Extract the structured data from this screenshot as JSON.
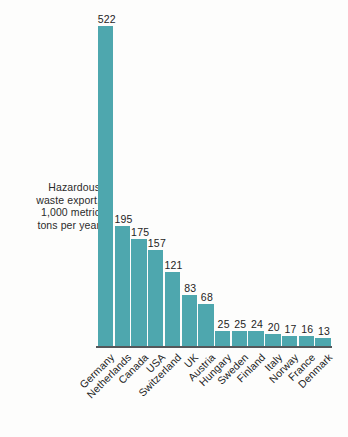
{
  "chart_data": {
    "type": "bar",
    "title": "",
    "subtitle": "",
    "xlabel": "",
    "ylabel": "Hazardous waste export,\n1,000 metric\ntons per year",
    "ylim": [
      0,
      522
    ],
    "grid": false,
    "legend": null,
    "bar_color": "#4ea7ae",
    "axis_color": "#55575a",
    "label_color": "#242424",
    "background": "#fdfdfc",
    "categories": [
      "Germany",
      "Netherlands",
      "Canada",
      "USA",
      "Switzerland",
      "UK",
      "Austria",
      "Hungary",
      "Sweden",
      "Finland",
      "Italy",
      "Norway",
      "France",
      "Denmark"
    ],
    "values": [
      522,
      195,
      175,
      157,
      121,
      83,
      68,
      25,
      25,
      24,
      20,
      17,
      16,
      13
    ],
    "value_labels": [
      "522",
      "195",
      "175",
      "157",
      "121",
      "83",
      "68",
      "25",
      "25",
      "24",
      "20",
      "17",
      "16",
      "13"
    ]
  },
  "caption": {
    "text": "Hazardous\nwaste export,\n1,000 metric\ntons per year"
  }
}
